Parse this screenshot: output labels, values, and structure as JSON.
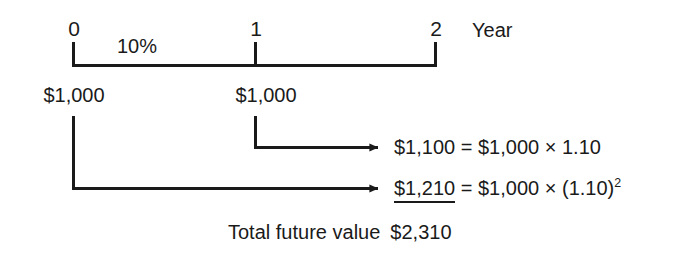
{
  "diagram": {
    "type": "timeline-cash-flow",
    "title_label": "Year",
    "timeline": {
      "axis_from_x_year": 0,
      "axis_to_x_year": 2,
      "ticks": [
        {
          "label": "0",
          "year": 0
        },
        {
          "label": "1",
          "year": 1
        },
        {
          "label": "2",
          "year": 2
        }
      ],
      "interest_rate_label": "10%"
    },
    "cash_flows": [
      {
        "year": 0,
        "label": "$1,000"
      },
      {
        "year": 1,
        "label": "$1,000"
      }
    ],
    "results": [
      {
        "id": "fv-year-1-deposit",
        "from_year": 1,
        "amount": "$1,100",
        "equals": "=",
        "base": "$1,000",
        "times": "×",
        "factor": "1.10",
        "exponent": "",
        "underlined": false
      },
      {
        "id": "fv-year-0-deposit",
        "from_year": 0,
        "amount": "$1,210",
        "equals": "=",
        "base": "$1,000",
        "times": "×",
        "factor": "(1.10)",
        "exponent": "2",
        "underlined": true
      }
    ],
    "total": {
      "caption": "Total future value",
      "amount": "$2,310"
    },
    "colors": {
      "ink": "#1a1a1a",
      "background": "#ffffff"
    }
  }
}
